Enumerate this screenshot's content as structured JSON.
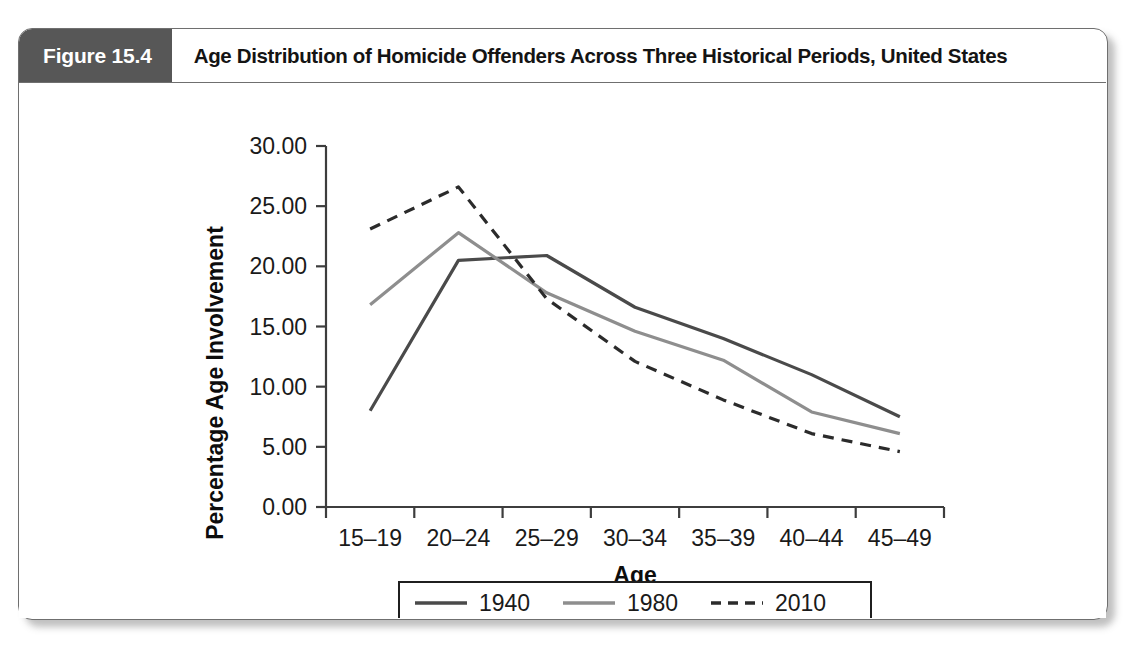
{
  "figure": {
    "badge_label": "Figure 15.4",
    "title": "Age Distribution of Homicide Offenders Across Three Historical Periods, United States"
  },
  "colors": {
    "badge_background": "#575757",
    "frame_border": "#6f6f6f",
    "series_1940": "#4a4a4a",
    "series_1980": "#8e8e8e",
    "series_2010": "#2b2b2b",
    "axis": "#3d3d3d",
    "background": "#ffffff"
  },
  "chart_data": {
    "type": "line",
    "title": "Age Distribution of Homicide Offenders Across Three Historical Periods, United States",
    "xlabel": "Age",
    "ylabel": "Percentage Age Involvement",
    "categories": [
      "15–19",
      "20–24",
      "25–29",
      "30–34",
      "35–39",
      "40–44",
      "45–49"
    ],
    "ylim": [
      0,
      30
    ],
    "yticks": [
      0,
      5,
      10,
      15,
      20,
      25,
      30
    ],
    "ytick_labels": [
      "0.00",
      "5.00",
      "10.00",
      "15.00",
      "20.00",
      "25.00",
      "30.00"
    ],
    "grid": false,
    "legend_position": "bottom",
    "series": [
      {
        "name": "1940",
        "style": "solid",
        "color": "#4a4a4a",
        "values": [
          8.0,
          20.5,
          20.9,
          16.6,
          14.0,
          11.0,
          7.5
        ]
      },
      {
        "name": "1980",
        "style": "solid",
        "color": "#8e8e8e",
        "values": [
          16.8,
          22.8,
          17.8,
          14.6,
          12.2,
          7.9,
          6.1
        ]
      },
      {
        "name": "2010",
        "style": "dashed",
        "color": "#2b2b2b",
        "values": [
          23.1,
          26.6,
          17.3,
          12.1,
          8.9,
          6.1,
          4.6
        ]
      }
    ]
  }
}
